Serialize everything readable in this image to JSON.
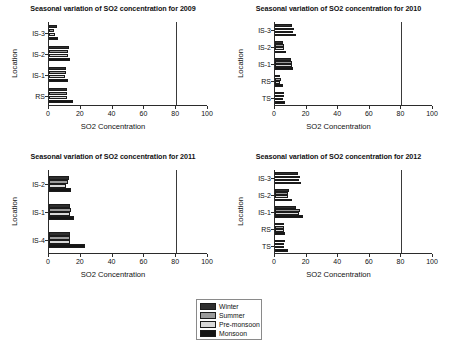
{
  "figure": {
    "width": 451,
    "height": 350,
    "background": "#ffffff"
  },
  "legend": {
    "name": "season-legend",
    "entries": [
      {
        "label": "Winter",
        "color": "#2e2e2e"
      },
      {
        "label": "Summer",
        "color": "#9a9a9a"
      },
      {
        "label": "Pre-monsoon",
        "color": "#d9d9d9"
      },
      {
        "label": "Monsoon",
        "color": "#151515"
      }
    ]
  },
  "chart_data": [
    {
      "type": "bar",
      "orientation": "horizontal",
      "title": "Seasonal variation of SO2 concentration for 2009",
      "xlabel": "SO2 Concentration",
      "ylabel": "Location",
      "xlim": [
        0,
        100
      ],
      "xticks": [
        0,
        20,
        40,
        60,
        80,
        100
      ],
      "grid": false,
      "reference_line_x": 80,
      "legend_position": "below-figure",
      "categories": [
        "IS-3",
        "IS-2",
        "IS-1",
        "RS"
      ],
      "series": [
        {
          "name": "Winter",
          "color": "#2e2e2e",
          "values": [
            5.0,
            12.5,
            10.5,
            11.5
          ]
        },
        {
          "name": "Summer",
          "color": "#9a9a9a",
          "values": [
            3.0,
            12.0,
            10.5,
            11.5
          ]
        },
        {
          "name": "Pre-monsoon",
          "color": "#d9d9d9",
          "values": [
            3.5,
            12.0,
            10.0,
            11.5
          ]
        },
        {
          "name": "Monsoon",
          "color": "#151515",
          "values": [
            5.5,
            13.5,
            12.0,
            15.0
          ]
        }
      ]
    },
    {
      "type": "bar",
      "orientation": "horizontal",
      "title": "Seasonal variation of SO2 concentration for 2010",
      "xlabel": "SO2 Concentration",
      "ylabel": "Location",
      "xlim": [
        0,
        100
      ],
      "xticks": [
        0,
        20,
        40,
        60,
        80,
        100
      ],
      "grid": false,
      "reference_line_x": 80,
      "legend_position": "below-figure",
      "categories": [
        "IS-3",
        "IS-2",
        "IS-1",
        "RS",
        "TS"
      ],
      "series": [
        {
          "name": "Winter",
          "color": "#2e2e2e",
          "values": [
            11.0,
            5.0,
            10.0,
            3.0,
            5.5
          ]
        },
        {
          "name": "Summer",
          "color": "#9a9a9a",
          "values": [
            12.0,
            6.0,
            11.0,
            3.5,
            5.5
          ]
        },
        {
          "name": "Pre-monsoon",
          "color": "#d9d9d9",
          "values": [
            11.5,
            5.5,
            10.5,
            3.0,
            5.0
          ]
        },
        {
          "name": "Monsoon",
          "color": "#151515",
          "values": [
            13.0,
            7.0,
            11.5,
            5.0,
            6.5
          ]
        }
      ]
    },
    {
      "type": "bar",
      "orientation": "horizontal",
      "title": "Seasonal variation of SO2 concentration for 2011",
      "xlabel": "SO2 Concentration",
      "ylabel": "Location",
      "xlim": [
        0,
        100
      ],
      "xticks": [
        0,
        20,
        40,
        60,
        80,
        100
      ],
      "grid": false,
      "reference_line_x": 80,
      "legend_position": "below-figure",
      "categories": [
        "IS-2",
        "IS-1",
        "IS-4"
      ],
      "series": [
        {
          "name": "Winter",
          "color": "#2e2e2e",
          "values": [
            12.5,
            13.5,
            13.0
          ]
        },
        {
          "name": "Summer",
          "color": "#9a9a9a",
          "values": [
            12.0,
            14.0,
            13.0
          ]
        },
        {
          "name": "Pre-monsoon",
          "color": "#d9d9d9",
          "values": [
            11.0,
            13.5,
            13.5
          ]
        },
        {
          "name": "Monsoon",
          "color": "#151515",
          "values": [
            14.0,
            15.5,
            22.5
          ]
        }
      ]
    },
    {
      "type": "bar",
      "orientation": "horizontal",
      "title": "Seasonal variation of SO2 concentration for 2012",
      "xlabel": "SO2 Concentration",
      "ylabel": "Location",
      "xlim": [
        0,
        100
      ],
      "xticks": [
        0,
        20,
        40,
        60,
        80,
        100
      ],
      "grid": false,
      "reference_line_x": 80,
      "legend_position": "below-figure",
      "categories": [
        "IS-3",
        "IS-2",
        "IS-1",
        "RS",
        "TS"
      ],
      "series": [
        {
          "name": "Winter",
          "color": "#2e2e2e",
          "values": [
            14.5,
            9.0,
            13.5,
            5.5,
            6.5
          ]
        },
        {
          "name": "Summer",
          "color": "#9a9a9a",
          "values": [
            16.0,
            8.0,
            16.0,
            6.0,
            6.0
          ]
        },
        {
          "name": "Pre-monsoon",
          "color": "#d9d9d9",
          "values": [
            15.0,
            8.5,
            15.5,
            5.5,
            6.0
          ]
        },
        {
          "name": "Monsoon",
          "color": "#151515",
          "values": [
            16.5,
            10.5,
            17.5,
            6.5,
            8.0
          ]
        }
      ]
    }
  ],
  "panels": [
    {
      "left": 0,
      "top": 4,
      "width": 226,
      "height": 146
    },
    {
      "left": 226,
      "top": 4,
      "width": 225,
      "height": 146
    },
    {
      "left": 0,
      "top": 152,
      "width": 226,
      "height": 146
    },
    {
      "left": 226,
      "top": 152,
      "width": 225,
      "height": 146
    }
  ]
}
